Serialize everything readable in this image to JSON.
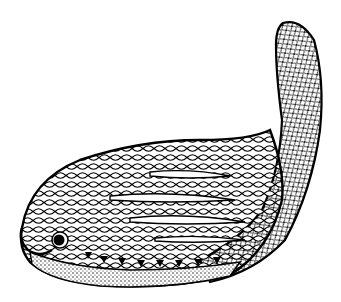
{
  "image": {
    "subject": "scaled fish-like creature illustration",
    "style": "black and white pen-and-ink line drawing",
    "colors": {
      "background": "#ffffff",
      "ink": "#000000"
    }
  },
  "figure_parts": [
    "head",
    "eye",
    "body-scales",
    "lateral-slits",
    "ventral-band",
    "teeth-row",
    "tail"
  ]
}
